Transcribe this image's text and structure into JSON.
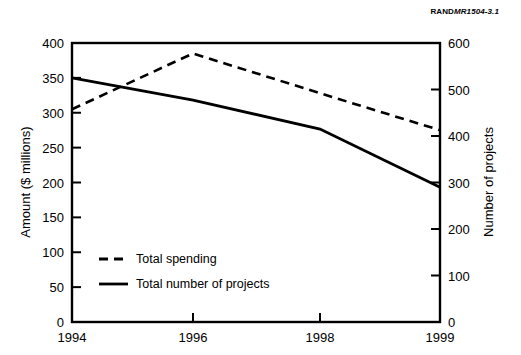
{
  "figure": {
    "doc_id_prefix": "RAND",
    "doc_id_italic": "MR1504-3.1",
    "doc_id_full": "RANDMR1504-3.1"
  },
  "chart_data": {
    "type": "line",
    "title": "",
    "xlabel": "",
    "categories": [
      "1994",
      "1996",
      "1998",
      "1999"
    ],
    "x": [
      1994,
      1996,
      1998,
      1999
    ],
    "grid": false,
    "legend_position": "inside-bottom-left",
    "axes": {
      "left": {
        "label": "Amount ($ millions)",
        "ticks": [
          0,
          50,
          100,
          150,
          200,
          250,
          300,
          350,
          400
        ],
        "tick_labels": [
          "0",
          "50",
          "100",
          "150",
          "200",
          "250",
          "300",
          "350",
          "400"
        ],
        "lim": [
          0,
          400
        ]
      },
      "right": {
        "label": "Number of projects",
        "ticks": [
          0,
          100,
          200,
          300,
          400,
          500,
          600
        ],
        "tick_labels": [
          "0",
          "100",
          "200",
          "300",
          "400",
          "500",
          "600"
        ],
        "lim": [
          0,
          600
        ]
      }
    },
    "series": [
      {
        "name": "Total spending",
        "axis": "left",
        "style": "dashed",
        "color": "#000000",
        "values": [
          305,
          385,
          328,
          275
        ]
      },
      {
        "name": "Total number of projects",
        "axis": "right",
        "style": "solid",
        "color": "#000000",
        "values": [
          525,
          477,
          415,
          290
        ]
      }
    ],
    "legend": [
      {
        "label": "Total spending",
        "style": "dashed"
      },
      {
        "label": "Total number of projects",
        "style": "solid"
      }
    ]
  }
}
